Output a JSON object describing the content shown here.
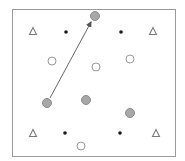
{
  "diagram": {
    "frame": {
      "x": 12,
      "y": 9,
      "width": 163,
      "height": 147,
      "stroke": "#9a9a9a"
    },
    "colors": {
      "grey_fill": "#a8a8a8",
      "grey_stroke": "#8a8a8a",
      "open_stroke": "#9a9a9a",
      "dot_fill": "#1a1a1a",
      "triangle_stroke": "#7a7a7a",
      "arrow": "#555555"
    },
    "triangles": [
      {
        "x": 33,
        "y": 31
      },
      {
        "x": 153,
        "y": 31
      },
      {
        "x": 33,
        "y": 133
      },
      {
        "x": 156,
        "y": 133
      }
    ],
    "dots": [
      {
        "x": 66,
        "y": 32
      },
      {
        "x": 121,
        "y": 32
      },
      {
        "x": 65,
        "y": 133
      },
      {
        "x": 120,
        "y": 133
      }
    ],
    "open_circles": [
      {
        "x": 52,
        "y": 61
      },
      {
        "x": 96,
        "y": 67
      },
      {
        "x": 130,
        "y": 59
      },
      {
        "x": 81,
        "y": 146
      }
    ],
    "grey_circles": [
      {
        "x": 95,
        "y": 16
      },
      {
        "x": 47,
        "y": 103
      },
      {
        "x": 86,
        "y": 100
      },
      {
        "x": 130,
        "y": 113
      }
    ],
    "arrow": {
      "from": {
        "x": 50,
        "y": 98
      },
      "to": {
        "x": 91,
        "y": 22
      }
    }
  }
}
